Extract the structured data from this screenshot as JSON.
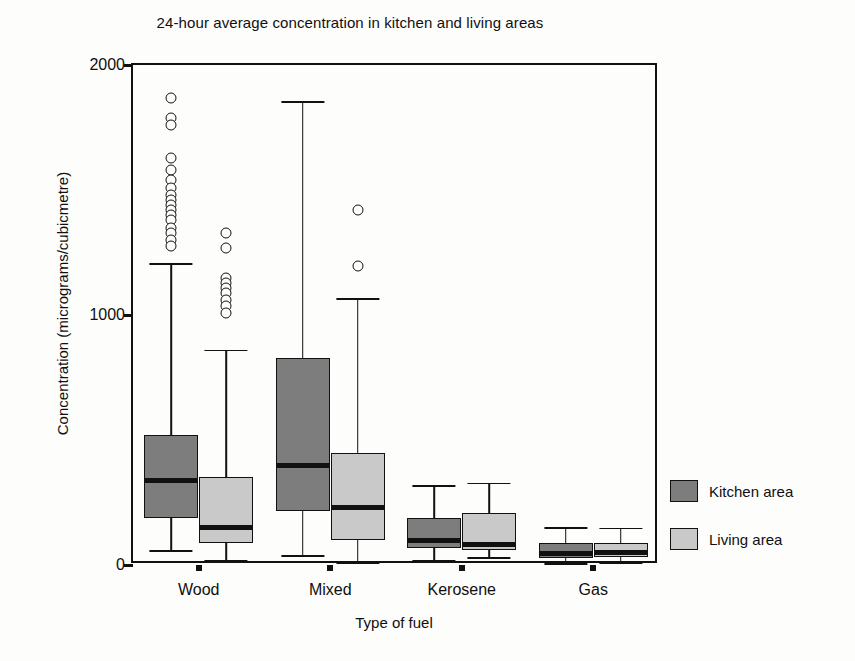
{
  "chart_data": {
    "type": "box",
    "title": "24-hour average concentration in kitchen and living areas",
    "xlabel": "Type of fuel",
    "ylabel": "Concentration (micrograms/cubicmetre)",
    "categories": [
      "Wood",
      "Mixed",
      "Kerosene",
      "Gas"
    ],
    "ylim": [
      0,
      2000
    ],
    "yticks": [
      0,
      1000,
      2000
    ],
    "ytick_labels": [
      "0",
      "1000",
      "2000"
    ],
    "grid": false,
    "legend_position": "right",
    "colors": {
      "kitchen": "#7d7d7d",
      "living": "#c9c9c9",
      "line": "#111111",
      "background": "#fdfdfb"
    },
    "legend": [
      {
        "key": "kitchen",
        "label": "Kitchen area",
        "color": "#7d7d7d"
      },
      {
        "key": "living",
        "label": "Living area",
        "color": "#c9c9c9"
      }
    ],
    "series": [
      {
        "name": "Kitchen area",
        "key": "kitchen",
        "boxes": [
          {
            "category": "Wood",
            "whisker_low": 60,
            "q1": 188,
            "median": 340,
            "q3": 520,
            "whisker_high": 1208,
            "outliers": [
              1870,
              1790,
              1760,
              1630,
              1580,
              1540,
              1510,
              1480,
              1460,
              1440,
              1420,
              1400,
              1380,
              1350,
              1330,
              1300,
              1275
            ]
          },
          {
            "category": "Mixed",
            "whisker_low": 40,
            "q1": 215,
            "median": 400,
            "q3": 830,
            "whisker_high": 1855,
            "outliers": []
          },
          {
            "category": "Kerosene",
            "whisker_low": 20,
            "q1": 70,
            "median": 98,
            "q3": 190,
            "whisker_high": 320,
            "outliers": []
          },
          {
            "category": "Gas",
            "whisker_low": 8,
            "q1": 30,
            "median": 48,
            "q3": 88,
            "whisker_high": 152,
            "outliers": []
          }
        ]
      },
      {
        "name": "Living area",
        "key": "living",
        "boxes": [
          {
            "category": "Wood",
            "whisker_low": 20,
            "q1": 88,
            "median": 150,
            "q3": 352,
            "whisker_high": 862,
            "outliers": [
              1330,
              1270,
              1150,
              1130,
              1110,
              1090,
              1060,
              1035,
              1010
            ]
          },
          {
            "category": "Mixed",
            "whisker_low": 10,
            "q1": 100,
            "median": 232,
            "q3": 448,
            "whisker_high": 1068,
            "outliers": [
              1420,
              1195
            ]
          },
          {
            "category": "Kerosene",
            "whisker_low": 32,
            "q1": 62,
            "median": 82,
            "q3": 210,
            "whisker_high": 330,
            "outliers": []
          },
          {
            "category": "Gas",
            "whisker_low": 10,
            "q1": 32,
            "median": 52,
            "q3": 90,
            "whisker_high": 150,
            "outliers": []
          }
        ]
      }
    ]
  }
}
